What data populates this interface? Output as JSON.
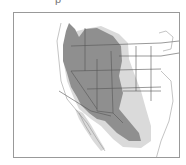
{
  "caption": "p",
  "map": {
    "region": "Western North America",
    "legend_colors": {
      "primary_range": "#8f8f8f",
      "secondary_range": "#dadada",
      "borders": "#555555",
      "frame": "#999999"
    },
    "layers": [
      {
        "name": "primary-range",
        "color": "#8f8f8f"
      },
      {
        "name": "secondary-range",
        "color": "#dadada"
      }
    ]
  }
}
